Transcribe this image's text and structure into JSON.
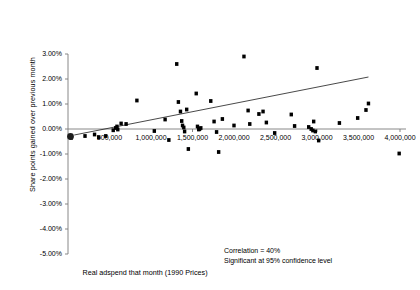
{
  "chart_data": {
    "type": "scatter",
    "title": "",
    "xlabel": "Real adspend that month (1990 Prices)",
    "ylabel": "Share points gained over previous month",
    "xlim": [
      0,
      4150000
    ],
    "ylim": [
      -0.05,
      0.03
    ],
    "grid": false,
    "legend": null,
    "xticks": [
      {
        "value": 500000,
        "label": "500,000"
      },
      {
        "value": 1000000,
        "label": "1,000,000"
      },
      {
        "value": 1500000,
        "label": "1,500,000"
      },
      {
        "value": 2000000,
        "label": "2,000,000"
      },
      {
        "value": 2500000,
        "label": "2,500,000"
      },
      {
        "value": 3000000,
        "label": "3,000,000"
      },
      {
        "value": 3500000,
        "label": "3,500,000"
      },
      {
        "value": 4000000,
        "label": "4,000,000"
      }
    ],
    "yticks": [
      {
        "value": 0.03,
        "label": "3.00%"
      },
      {
        "value": 0.02,
        "label": "2.00%"
      },
      {
        "value": 0.01,
        "label": "1.00%"
      },
      {
        "value": 0.0,
        "label": "0.00%"
      },
      {
        "value": -0.01,
        "label": "-1.00%"
      },
      {
        "value": -0.02,
        "label": "-2.00%"
      },
      {
        "value": -0.03,
        "label": "-3.00%"
      },
      {
        "value": -0.04,
        "label": "-4.00%"
      },
      {
        "value": -0.05,
        "label": "-5.00%"
      }
    ],
    "annotations": [
      "Correlation = 40%",
      "Significant at 95% confidence level"
    ],
    "trendline": {
      "x0": 75000,
      "y0": -0.0024,
      "x1": 3620000,
      "y1": 0.0208
    },
    "points": [
      {
        "x": 40000,
        "y": -0.0035
      },
      {
        "x": 205000,
        "y": -0.0028
      },
      {
        "x": 320000,
        "y": -0.0022
      },
      {
        "x": 370000,
        "y": -0.0033
      },
      {
        "x": 455000,
        "y": -0.0028
      },
      {
        "x": 545000,
        "y": -0.0005
      },
      {
        "x": 575000,
        "y": 0.0004
      },
      {
        "x": 590000,
        "y": 0.001
      },
      {
        "x": 600000,
        "y": -0.0002
      },
      {
        "x": 640000,
        "y": 0.0022
      },
      {
        "x": 700000,
        "y": 0.002
      },
      {
        "x": 830000,
        "y": 0.0114
      },
      {
        "x": 1040000,
        "y": -0.0008
      },
      {
        "x": 1170000,
        "y": 0.0038
      },
      {
        "x": 1215000,
        "y": -0.0044
      },
      {
        "x": 1310000,
        "y": 0.026
      },
      {
        "x": 1330000,
        "y": 0.0108
      },
      {
        "x": 1355000,
        "y": 0.007
      },
      {
        "x": 1370000,
        "y": 0.0032
      },
      {
        "x": 1380000,
        "y": 0.0014
      },
      {
        "x": 1395000,
        "y": 0.0006
      },
      {
        "x": 1405000,
        "y": -0.001
      },
      {
        "x": 1430000,
        "y": 0.0078
      },
      {
        "x": 1450000,
        "y": -0.008
      },
      {
        "x": 1545000,
        "y": 0.0142
      },
      {
        "x": 1560000,
        "y": 0.001
      },
      {
        "x": 1575000,
        "y": -0.0002
      },
      {
        "x": 1585000,
        "y": 0.0
      },
      {
        "x": 1600000,
        "y": 0.0004
      },
      {
        "x": 1720000,
        "y": 0.0112
      },
      {
        "x": 1760000,
        "y": 0.003
      },
      {
        "x": 1790000,
        "y": -0.0012
      },
      {
        "x": 1815000,
        "y": -0.0092
      },
      {
        "x": 1860000,
        "y": 0.004
      },
      {
        "x": 2000000,
        "y": 0.0014
      },
      {
        "x": 2120000,
        "y": 0.029
      },
      {
        "x": 2170000,
        "y": 0.0074
      },
      {
        "x": 2190000,
        "y": 0.002
      },
      {
        "x": 2300000,
        "y": 0.006
      },
      {
        "x": 2350000,
        "y": 0.007
      },
      {
        "x": 2390000,
        "y": 0.0026
      },
      {
        "x": 2490000,
        "y": -0.0016
      },
      {
        "x": 2690000,
        "y": 0.0058
      },
      {
        "x": 2730000,
        "y": 0.0012
      },
      {
        "x": 2900000,
        "y": 0.0008
      },
      {
        "x": 2930000,
        "y": 0.0
      },
      {
        "x": 2950000,
        "y": -0.0006
      },
      {
        "x": 2960000,
        "y": 0.003
      },
      {
        "x": 2980000,
        "y": -0.001
      },
      {
        "x": 3000000,
        "y": 0.0244
      },
      {
        "x": 3020000,
        "y": -0.0046
      },
      {
        "x": 3270000,
        "y": 0.0024
      },
      {
        "x": 3490000,
        "y": 0.0044
      },
      {
        "x": 3590000,
        "y": 0.0076
      },
      {
        "x": 3620000,
        "y": 0.0102
      },
      {
        "x": 3990000,
        "y": -0.0098
      }
    ],
    "origin_marker": {
      "x": 30000,
      "y": -0.003
    }
  }
}
